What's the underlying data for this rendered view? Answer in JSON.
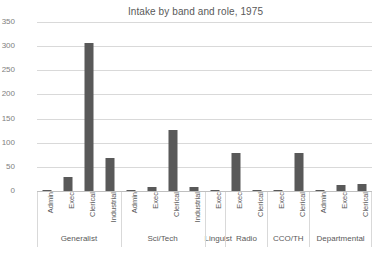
{
  "chart_data": {
    "type": "bar",
    "title": "Intake by band and role, 1975",
    "xlabel": "",
    "ylabel": "",
    "ylim": [
      0,
      350
    ],
    "ytick_step": 50,
    "yticks": [
      "350",
      "300",
      "250",
      "200",
      "150",
      "100",
      "50",
      "0"
    ],
    "grid": true,
    "legend": "none",
    "bar_color": "#595959",
    "grid_color": "#d9d9d9",
    "categories": [
      "Admin",
      "Exec",
      "Clerical",
      "Industrial",
      "Admin",
      "Exec",
      "Clerical",
      "Industrial",
      "Exec",
      "Exec",
      "Clerical",
      "Exec",
      "Clerical",
      "Admin",
      "Exec",
      "Clerical"
    ],
    "values": [
      2,
      28,
      307,
      69,
      1,
      9,
      127,
      8,
      1,
      78,
      1,
      3,
      78,
      1,
      12,
      15
    ],
    "groups": [
      {
        "label": "Generalist",
        "count": 4
      },
      {
        "label": "Sci/Tech",
        "count": 4
      },
      {
        "label": "Linguist",
        "count": 1
      },
      {
        "label": "Radio",
        "count": 2
      },
      {
        "label": "CCO/TH",
        "count": 2
      },
      {
        "label": "Departmental",
        "count": 3
      }
    ]
  }
}
